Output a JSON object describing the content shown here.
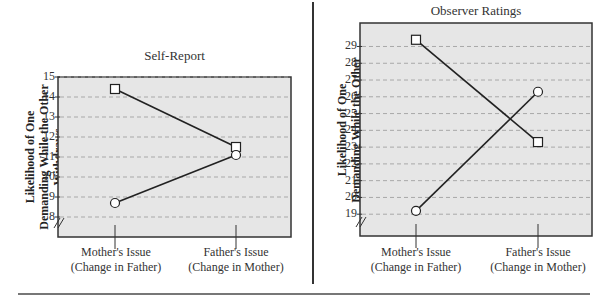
{
  "chart_data": [
    {
      "type": "line",
      "title": "Self-Report",
      "xlabel": "",
      "ylabel": "Likelihood of One Demanding While the Other Withdraws",
      "categories": [
        "Mother's Issue (Change in Father)",
        "Father's Issue (Change in Mother)"
      ],
      "category_lines": [
        [
          "Mother's Issue",
          "(Change in Father)"
        ],
        [
          "Father's Issue",
          "(Change in Mother)"
        ]
      ],
      "yticks": [
        8,
        9,
        10,
        11,
        12,
        13,
        14,
        15
      ],
      "ylim": [
        7,
        15
      ],
      "grid": true,
      "axis_break": true,
      "legend": "none",
      "series": [
        {
          "name": "square-marker series",
          "marker": "square",
          "values": [
            14.4,
            11.5
          ]
        },
        {
          "name": "circle-marker series",
          "marker": "circle",
          "values": [
            8.7,
            11.1
          ]
        }
      ]
    },
    {
      "type": "line",
      "title": "Observer Ratings",
      "xlabel": "",
      "ylabel": "Likelihood of One Demanding While the Other Withdraws",
      "categories": [
        "Mother's Issue (Change in Father)",
        "Father's Issue (Change in Mother)"
      ],
      "category_lines": [
        [
          "Mother's Issue",
          "(Change in Father)"
        ],
        [
          "Father's Issue",
          "(Change in Mother)"
        ]
      ],
      "yticks": [
        19,
        20,
        21,
        22,
        23,
        24,
        25,
        26,
        27,
        28,
        29
      ],
      "ylim": [
        17.7,
        30.4
      ],
      "grid": true,
      "axis_break": true,
      "legend": "none",
      "series": [
        {
          "name": "square-marker series",
          "marker": "square",
          "values": [
            29.4,
            23.3
          ]
        },
        {
          "name": "circle-marker series",
          "marker": "circle",
          "values": [
            19.2,
            26.3
          ]
        }
      ]
    }
  ],
  "colors": {
    "plot_bg": "#e6e6e6",
    "gridline": "#a8a8a8",
    "line": "#222222",
    "marker_fill": "#ffffff"
  }
}
